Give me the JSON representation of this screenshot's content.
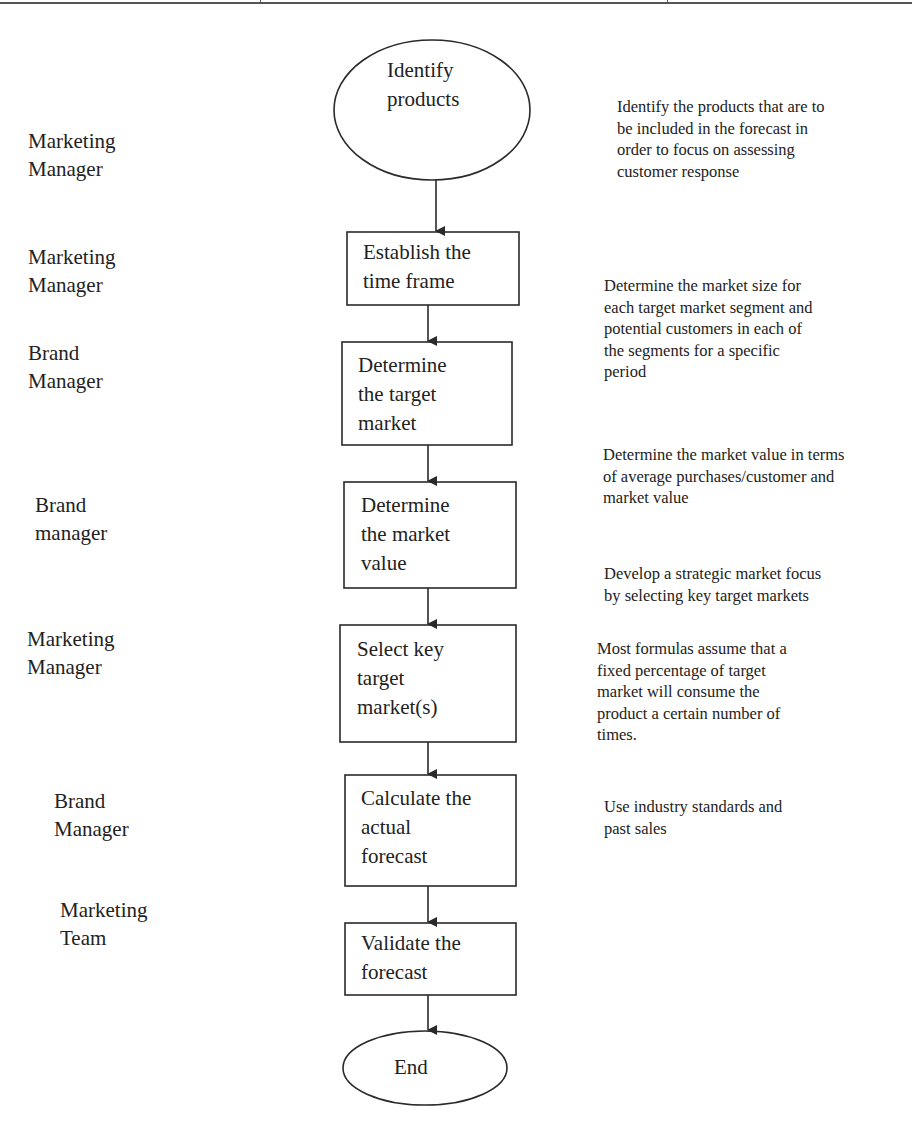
{
  "diagram": {
    "type": "flowchart",
    "start": {
      "shape": "ellipse",
      "label_lines": [
        "Identify",
        "products"
      ]
    },
    "steps": [
      {
        "shape": "rectangle",
        "label_lines": [
          "Establish the",
          "time frame"
        ]
      },
      {
        "shape": "rectangle",
        "label_lines": [
          "Determine",
          "the target",
          "market"
        ]
      },
      {
        "shape": "rectangle",
        "label_lines": [
          "Determine",
          "the market",
          "value"
        ]
      },
      {
        "shape": "rectangle",
        "label_lines": [
          "Select key",
          "target",
          "market(s)"
        ]
      },
      {
        "shape": "rectangle",
        "label_lines": [
          "Calculate the",
          "actual",
          "forecast"
        ]
      },
      {
        "shape": "rectangle",
        "label_lines": [
          "Validate the",
          "forecast"
        ]
      }
    ],
    "end": {
      "shape": "ellipse",
      "label_lines": [
        "End"
      ]
    },
    "roles": [
      {
        "lines": [
          "Marketing",
          "Manager"
        ]
      },
      {
        "lines": [
          "Marketing",
          "Manager"
        ]
      },
      {
        "lines": [
          "Brand",
          "Manager"
        ]
      },
      {
        "lines": [
          "Brand",
          "manager"
        ]
      },
      {
        "lines": [
          "Marketing",
          "Manager"
        ]
      },
      {
        "lines": [
          "Brand",
          "Manager"
        ]
      },
      {
        "lines": [
          "Marketing",
          "Team"
        ]
      }
    ],
    "descriptions": [
      {
        "lines": [
          "Identify the products that are to",
          "be included in the forecast in",
          "order to focus on assessing",
          "customer response"
        ]
      },
      {
        "lines": [
          "Determine the market size for",
          "each target market segment and",
          "potential customers in each of",
          "the segments for a specific",
          "period"
        ]
      },
      {
        "lines": [
          "Determine the market value in terms",
          "of average purchases/customer and",
          "market value"
        ]
      },
      {
        "lines": [
          "Develop a strategic market focus",
          "by selecting key target markets"
        ]
      },
      {
        "lines": [
          "Most formulas assume that a",
          "fixed percentage of target",
          "market will consume the",
          "product a certain number of",
          "times."
        ]
      },
      {
        "lines": [
          "Use industry standards and",
          "past sales"
        ]
      }
    ],
    "colors": {
      "stroke": "#2a2a2a",
      "text": "#222222",
      "background": "#ffffff"
    }
  }
}
